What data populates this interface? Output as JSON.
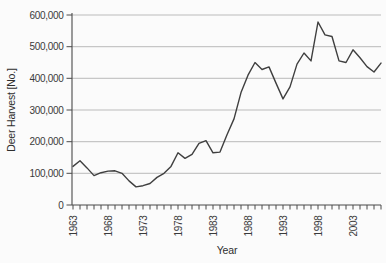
{
  "chart_data": {
    "type": "line",
    "title": "",
    "xlabel": "Year",
    "ylabel": "Deer Harvest [No.]",
    "xlim": [
      1963,
      2007
    ],
    "ylim": [
      0,
      600000
    ],
    "grid": "horizontal-only",
    "legend": "none",
    "y_ticks": [
      0,
      100000,
      200000,
      300000,
      400000,
      500000,
      600000
    ],
    "y_tick_labels": [
      "0",
      "100,000",
      "200,000",
      "300,000",
      "400,000",
      "500,000",
      "600,000"
    ],
    "x_labeled_ticks": [
      1963,
      1968,
      1973,
      1978,
      1983,
      1988,
      1993,
      1998,
      2003
    ],
    "x_tick_labels": [
      "1963",
      "1968",
      "1973",
      "1978",
      "1983",
      "1988",
      "1993",
      "1998",
      "2003"
    ],
    "x_minor_tick_interval_years": 1,
    "colors": {
      "line": "#3f3f3f",
      "grid": "#b3b3b3",
      "axis": "#4a4a4a",
      "text": "#3a3a3a",
      "background": "#fbfbfb"
    },
    "series": [
      {
        "name": "Deer harvest",
        "x": [
          1963,
          1964,
          1965,
          1966,
          1967,
          1968,
          1969,
          1970,
          1971,
          1972,
          1973,
          1974,
          1975,
          1976,
          1977,
          1978,
          1979,
          1980,
          1981,
          1982,
          1983,
          1984,
          1985,
          1986,
          1987,
          1988,
          1989,
          1990,
          1991,
          1992,
          1993,
          1994,
          1995,
          1996,
          1997,
          1998,
          1999,
          2000,
          2001,
          2002,
          2003,
          2004,
          2005,
          2006,
          2007
        ],
        "values": [
          122000,
          140000,
          117000,
          93000,
          102000,
          107000,
          108000,
          100000,
          76000,
          57000,
          61000,
          68000,
          87000,
          100000,
          122000,
          165000,
          147000,
          160000,
          195000,
          203000,
          165000,
          167000,
          222000,
          272000,
          355000,
          410000,
          450000,
          428000,
          436000,
          385000,
          335000,
          373000,
          445000,
          480000,
          455000,
          578000,
          537000,
          532000,
          455000,
          450000,
          490000,
          465000,
          437000,
          420000,
          448000
        ]
      }
    ]
  }
}
